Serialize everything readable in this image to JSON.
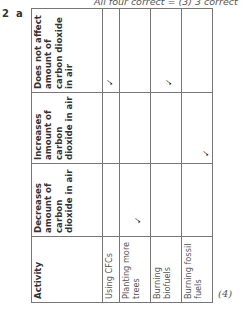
{
  "top_note": "All four correct = (3) 3 correct = (",
  "question": {
    "number": "2",
    "part": "a"
  },
  "marks": "(4)",
  "table": {
    "headers": {
      "activity": "Activity",
      "decreases": "Decreases amount of carbon dioxide in air",
      "increases": "Increases amount of carbon dioxide in air",
      "no_effect": "Does not affect amount of carbon dioxide in air"
    },
    "rows": [
      {
        "activity": "Using CFCs",
        "decreases": "",
        "increases": "",
        "no_effect": "✓"
      },
      {
        "activity": "Planting more trees",
        "decreases": "✓",
        "increases": "",
        "no_effect": ""
      },
      {
        "activity": "Burning biofuels",
        "decreases": "",
        "increases": "",
        "no_effect": "✓"
      },
      {
        "activity": "Burning fossil fuels",
        "decreases": "",
        "increases": "✓",
        "no_effect": ""
      }
    ]
  },
  "colors": {
    "border": "#777777",
    "text": "#333333",
    "muted": "#555555"
  }
}
